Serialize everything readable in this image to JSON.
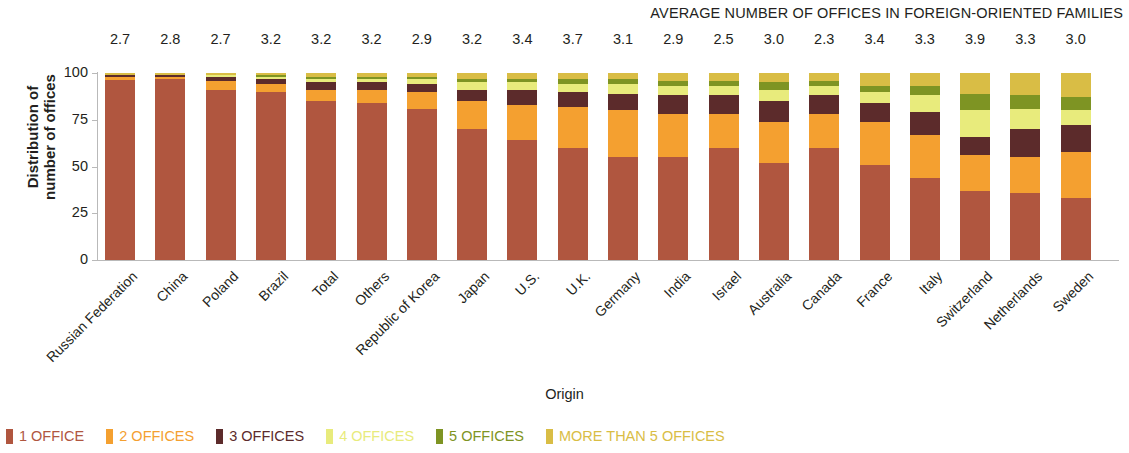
{
  "header": {
    "title": "AVERAGE NUMBER OF OFFICES IN FOREIGN-ORIENTED FAMILIES"
  },
  "axes": {
    "y_title_line1": "Distribution of",
    "y_title_line2": "number of offices",
    "x_title": "Origin",
    "y_ticks": [
      "0",
      "25",
      "50",
      "75",
      "100"
    ]
  },
  "chart_data": {
    "type": "bar",
    "stacked": true,
    "title": "AVERAGE NUMBER OF OFFICES IN FOREIGN-ORIENTED FAMILIES",
    "xlabel": "Origin",
    "ylabel": "Distribution of number of offices",
    "ylim": [
      0,
      100
    ],
    "yticks": [
      0,
      25,
      50,
      75,
      100
    ],
    "grid": false,
    "legend_position": "bottom",
    "categories": [
      "Russian Federation",
      "China",
      "Poland",
      "Brazil",
      "Total",
      "Others",
      "Republic of Korea",
      "Japan",
      "U.S.",
      "U.K.",
      "Germany",
      "India",
      "Israel",
      "Australia",
      "Canada",
      "France",
      "Italy",
      "Switzerland",
      "Netherlands",
      "Sweden"
    ],
    "annotation_label": "AVERAGE NUMBER OF OFFICES IN FOREIGN-ORIENTED FAMILIES",
    "annotations": [
      "2.7",
      "2.8",
      "2.7",
      "3.2",
      "3.2",
      "3.2",
      "2.9",
      "3.2",
      "3.4",
      "3.7",
      "3.1",
      "2.9",
      "2.5",
      "3.0",
      "2.3",
      "3.4",
      "3.3",
      "3.9",
      "3.3",
      "3.0"
    ],
    "series": [
      {
        "name": "1 OFFICE",
        "color": "#b0563f",
        "values": [
          96,
          97,
          91,
          90,
          85,
          84,
          81,
          70,
          64,
          60,
          55,
          55,
          60,
          52,
          60,
          51,
          44,
          37,
          36,
          33
        ]
      },
      {
        "name": "2 OFFICES",
        "color": "#f4a030",
        "values": [
          2,
          1,
          5,
          4,
          6,
          7,
          9,
          15,
          19,
          22,
          25,
          23,
          18,
          22,
          18,
          23,
          23,
          19,
          19,
          25
        ]
      },
      {
        "name": "3 OFFICES",
        "color": "#5c2b2b",
        "values": [
          1,
          1,
          2,
          3,
          4,
          4,
          4,
          6,
          8,
          8,
          9,
          10,
          10,
          11,
          10,
          10,
          12,
          10,
          15,
          14
        ]
      },
      {
        "name": "4 OFFICES",
        "color": "#e8eb7c",
        "values": [
          0,
          0,
          1,
          1,
          2,
          2,
          3,
          4,
          4,
          4,
          5,
          5,
          5,
          6,
          5,
          6,
          9,
          14,
          11,
          8
        ]
      },
      {
        "name": "5 OFFICES",
        "color": "#7e9423",
        "values": [
          0,
          0,
          0,
          1,
          1,
          1,
          1,
          2,
          2,
          3,
          3,
          3,
          3,
          4,
          3,
          3,
          5,
          9,
          7,
          7
        ]
      },
      {
        "name": "MORE THAN 5 OFFICES",
        "color": "#d9bd45",
        "values": [
          1,
          1,
          1,
          1,
          2,
          2,
          2,
          3,
          3,
          3,
          3,
          4,
          4,
          5,
          4,
          7,
          7,
          11,
          12,
          13
        ]
      }
    ]
  }
}
